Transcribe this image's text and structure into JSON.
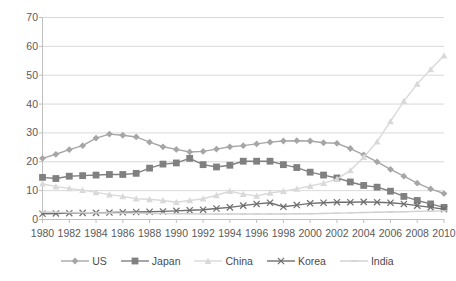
{
  "chart_data": {
    "type": "line",
    "title": "",
    "subtitle": "",
    "xlabel": "",
    "ylabel": "",
    "xlim": [
      1980,
      2010
    ],
    "ylim": [
      0,
      70
    ],
    "grid": true,
    "legend_position": "bottom",
    "yticks": [
      0,
      10,
      20,
      30,
      40,
      50,
      60,
      70
    ],
    "ytick_labels": [
      "0",
      "10",
      "20",
      "30",
      "40",
      "50",
      "60",
      "70"
    ],
    "x": [
      1980,
      1981,
      1982,
      1983,
      1984,
      1985,
      1986,
      1987,
      1988,
      1989,
      1990,
      1991,
      1992,
      1993,
      1994,
      1995,
      1996,
      1997,
      1998,
      1999,
      2000,
      2001,
      2002,
      2003,
      2004,
      2005,
      2006,
      2007,
      2008,
      2009,
      2010
    ],
    "xtick_labels": [
      "1980",
      "1982",
      "1984",
      "1986",
      "1988",
      "1990",
      "1992",
      "1994",
      "1996",
      "1998",
      "2000",
      "2002",
      "2004",
      "2006",
      "2008",
      "2010"
    ],
    "xticks": [
      1980,
      1982,
      1984,
      1986,
      1988,
      1990,
      1992,
      1994,
      1996,
      1998,
      2000,
      2002,
      2004,
      2006,
      2008,
      2010
    ],
    "series": [
      {
        "name": "US",
        "marker": "diamond",
        "color": "#a6a6a6",
        "values": [
          21.2,
          22.6,
          24.2,
          25.6,
          28.2,
          29.6,
          29.2,
          28.6,
          26.8,
          25.2,
          24.3,
          23.4,
          23.6,
          24.4,
          25.2,
          25.6,
          26.2,
          26.8,
          27.2,
          27.3,
          27.2,
          26.6,
          26.4,
          24.6,
          22.4,
          20.0,
          17.4,
          15.0,
          12.6,
          10.6,
          9.0
        ]
      },
      {
        "name": "Japan",
        "marker": "square",
        "color": "#808080",
        "values": [
          14.6,
          14.2,
          15.0,
          15.2,
          15.4,
          15.6,
          15.6,
          16.0,
          17.8,
          19.2,
          19.6,
          21.2,
          19.0,
          18.2,
          18.8,
          20.2,
          20.2,
          20.2,
          19.0,
          18.0,
          16.4,
          15.4,
          14.4,
          13.0,
          11.8,
          11.2,
          9.8,
          8.0,
          6.6,
          5.4,
          4.2
        ]
      },
      {
        "name": "China",
        "marker": "triangle",
        "color": "#d9d9d9",
        "values": [
          12.4,
          11.4,
          10.8,
          10.2,
          9.4,
          8.6,
          8.0,
          7.2,
          7.0,
          6.6,
          6.0,
          6.6,
          7.2,
          8.4,
          9.8,
          8.8,
          8.2,
          9.2,
          9.8,
          10.6,
          11.6,
          12.6,
          14.0,
          17.0,
          21.6,
          27.0,
          34.0,
          41.0,
          47.0,
          52.0,
          56.8
        ]
      },
      {
        "name": "Korea",
        "marker": "x",
        "color": "#6e6e6e",
        "values": [
          2.0,
          2.1,
          2.2,
          2.3,
          2.3,
          2.4,
          2.5,
          2.6,
          2.7,
          2.8,
          3.0,
          3.2,
          3.4,
          3.8,
          4.2,
          4.8,
          5.4,
          5.8,
          4.4,
          5.0,
          5.6,
          5.8,
          6.0,
          6.0,
          6.1,
          6.0,
          5.8,
          5.4,
          4.8,
          4.2,
          3.6
        ]
      },
      {
        "name": "India",
        "marker": "line",
        "color": "#d0d0d0",
        "values": [
          2.6,
          2.5,
          2.4,
          2.4,
          2.3,
          2.3,
          2.2,
          2.2,
          2.1,
          2.1,
          2.0,
          2.0,
          1.9,
          1.9,
          1.9,
          1.9,
          1.9,
          1.9,
          1.9,
          2.0,
          2.0,
          2.1,
          2.2,
          2.3,
          2.4,
          2.5,
          2.6,
          2.7,
          2.8,
          2.9,
          3.0
        ]
      }
    ]
  },
  "legend": {
    "items": [
      {
        "label": "US"
      },
      {
        "label": "Japan"
      },
      {
        "label": "China"
      },
      {
        "label": "Korea"
      },
      {
        "label": "India"
      }
    ]
  },
  "colors": {
    "grid": "#d9d9d9",
    "axis": "#bfbfbf",
    "tick_text": "#5a5a5a",
    "legend_text": "#4a4a4a",
    "background": "#ffffff"
  }
}
